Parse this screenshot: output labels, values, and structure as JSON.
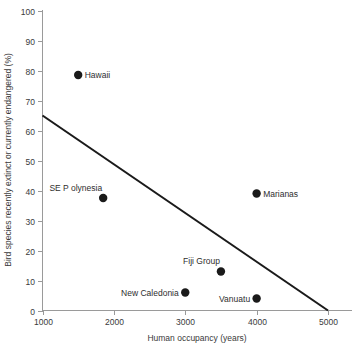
{
  "chart_data": {
    "type": "scatter",
    "title": "",
    "xlabel": "Human occupancy (years)",
    "ylabel": "Bird species recently extinct or currently endangered (%)",
    "xlim": [
      1000,
      5000
    ],
    "ylim": [
      0,
      100
    ],
    "xticks": [
      1000,
      2000,
      3000,
      4000,
      5000
    ],
    "xtick_labels": [
      "1000",
      "2000",
      "3000",
      "4000",
      "5000"
    ],
    "yticks": [
      0,
      10,
      20,
      30,
      40,
      50,
      60,
      70,
      80,
      90,
      100
    ],
    "ytick_labels": [
      "0",
      "10",
      "20",
      "30",
      "40",
      "50",
      "60",
      "70",
      "80",
      "90",
      "100"
    ],
    "grid": false,
    "legend": "none",
    "marker_color": "#1a1a1a",
    "line_color": "#1a1a1a",
    "axis_color": "#9a9a9a",
    "points": [
      {
        "label": "Hawaii",
        "x": 1500,
        "y": 78.5,
        "label_position": "right"
      },
      {
        "label": "SE P olynesia",
        "x": 1850,
        "y": 37.5,
        "label_position": "above-left"
      },
      {
        "label": "New Caledonia",
        "x": 3000,
        "y": 6.0,
        "label_position": "left"
      },
      {
        "label": "Fiji Group",
        "x": 3500,
        "y": 13.0,
        "label_position": "above-left"
      },
      {
        "label": "Vanuatu",
        "x": 4000,
        "y": 4.0,
        "label_position": "left"
      },
      {
        "label": "Marianas",
        "x": 4000,
        "y": 39.0,
        "label_position": "right"
      }
    ],
    "trend_line": {
      "x_start": 1000,
      "y_start": 65.0,
      "x_end": 5000,
      "y_end": 0.0
    }
  }
}
